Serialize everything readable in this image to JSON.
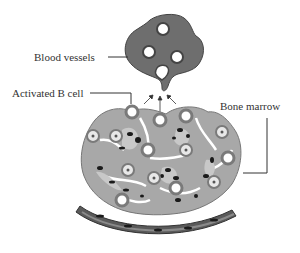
{
  "diagram": {
    "labels": {
      "blood_vessels": "Blood vessels",
      "activated_b_cell": "Activated B cell",
      "bone_marrow": "Bone marrow"
    },
    "colors": {
      "vessel_fill": "#6e6e6e",
      "marrow_fill": "#a8a8a8",
      "marrow_inner": "#c8c8c8",
      "cell_ring": "#7a7a7a",
      "dark_spots": "#1a1a1a",
      "line": "#333333",
      "bone_band": "#5a5a5a"
    }
  }
}
